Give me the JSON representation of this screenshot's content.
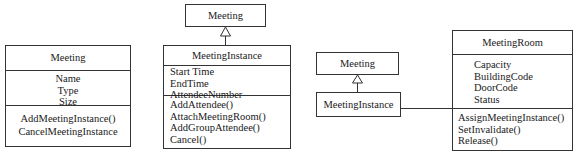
{
  "diagram": {
    "class_meeting_a": {
      "name": "Meeting",
      "attributes": [
        "Name",
        "Type",
        "Size"
      ],
      "operations": [
        "AddMeetingInstance()",
        "CancelMeetingInstance"
      ]
    },
    "class_meeting_b": {
      "name": "Meeting"
    },
    "class_meetinginstance_b": {
      "name": "MeetingInstance",
      "attributes": [
        "Start Time",
        "EndTime",
        "AttendeeNumber"
      ],
      "operations": [
        "AddAttendee()",
        "AttachMeetingRoom()",
        "AddGroupAttendee()",
        "Cancel()"
      ]
    },
    "class_meeting_c": {
      "name": "Meeting"
    },
    "class_meetinginstance_c": {
      "name": "MeetingInstance"
    },
    "class_meetingroom": {
      "name": "MeetingRoom",
      "attributes": [
        "Capacity",
        "BuildingCode",
        "DoorCode",
        "Status"
      ],
      "operations": [
        "AssignMeetingInstance()",
        "SetInvalidate()",
        "Release()"
      ]
    },
    "relations": [
      {
        "type": "generalization",
        "from": "MeetingInstance",
        "to": "Meeting"
      },
      {
        "type": "generalization",
        "from": "MeetingInstance",
        "to": "Meeting"
      },
      {
        "type": "association",
        "from": "MeetingInstance",
        "to": "MeetingRoom"
      }
    ]
  }
}
